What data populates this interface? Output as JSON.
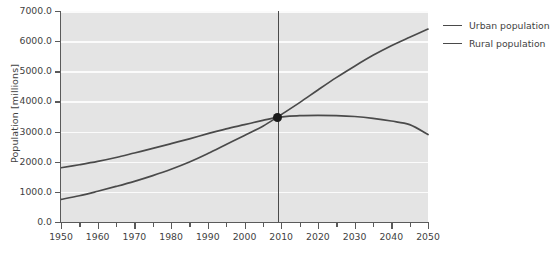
{
  "chart_data": {
    "type": "line",
    "title": "",
    "xlabel": "",
    "ylabel": "Population [millions]",
    "xlim": [
      1950,
      2050
    ],
    "ylim": [
      0,
      7000
    ],
    "grid": "horizontal",
    "legend_position": "right",
    "x": [
      1950,
      1955,
      1960,
      1965,
      1970,
      1975,
      1980,
      1985,
      1990,
      1995,
      2000,
      2005,
      2009,
      2010,
      2015,
      2020,
      2025,
      2030,
      2035,
      2040,
      2045,
      2050
    ],
    "series": [
      {
        "name": "Urban population",
        "color": "#4a4a4a",
        "values": [
          750,
          870,
          1020,
          1180,
          1350,
          1540,
          1750,
          1990,
          2270,
          2570,
          2870,
          3180,
          3480,
          3560,
          3960,
          4380,
          4790,
          5170,
          5530,
          5850,
          6130,
          6400
        ]
      },
      {
        "name": "Rural population",
        "color": "#4a4a4a",
        "values": [
          1800,
          1900,
          2010,
          2140,
          2290,
          2440,
          2600,
          2760,
          2930,
          3090,
          3230,
          3370,
          3480,
          3490,
          3530,
          3540,
          3530,
          3500,
          3440,
          3350,
          3230,
          2900
        ]
      }
    ],
    "y_ticks": [
      0,
      1000,
      2000,
      3000,
      4000,
      5000,
      6000,
      7000
    ],
    "y_tick_labels": [
      "0.0",
      "1000.0",
      "2000.0",
      "3000.0",
      "4000.0",
      "5000.0",
      "6000.0",
      "7000.0"
    ],
    "x_ticks": [
      1950,
      1960,
      1970,
      1980,
      1990,
      2000,
      2010,
      2020,
      2030,
      2040,
      2050
    ],
    "x_tick_labels": [
      "1950",
      "1960",
      "1970",
      "1980",
      "1990",
      "2000",
      "2010",
      "2020",
      "2030",
      "2040",
      "2050"
    ],
    "x_minor_ticks": [
      1955,
      1965,
      1975,
      1985,
      1995,
      2005,
      2015,
      2025,
      2035,
      2045
    ],
    "annotations": [
      {
        "type": "vertical-line",
        "x": 2009,
        "color": "#4a4a4a"
      },
      {
        "type": "point-marker",
        "x": 2009,
        "y": 3480,
        "color": "#1a1a1a"
      }
    ],
    "colors": {
      "plot_background": "#e4e4e4",
      "gridline": "#fbfbfb",
      "axis": "#5a5a5a",
      "text": "#3f3f3f",
      "page_background": "#ffffff"
    }
  },
  "legend": {
    "items": [
      {
        "label": "Urban population"
      },
      {
        "label": "Rural population"
      }
    ]
  }
}
